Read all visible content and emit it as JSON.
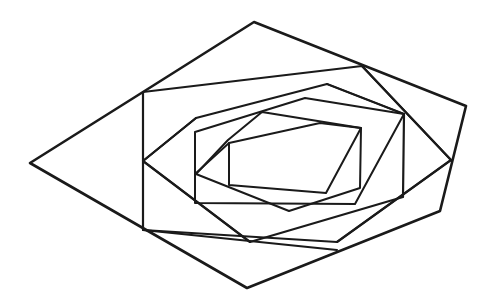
{
  "diagram": {
    "type": "nested-spiral-hexagons",
    "background": "#ffffff",
    "stroke_color": "#1a1a1a",
    "polygons": [
      {
        "name": "hexagon-0-outer",
        "width": 2.6,
        "points": [
          [
            254,
            22
          ],
          [
            466,
            106
          ],
          [
            440,
            211
          ],
          [
            247,
            288
          ],
          [
            30,
            163
          ],
          [
            143,
            92
          ]
        ]
      },
      {
        "name": "hexagon-1",
        "width": 2.2,
        "points": [
          [
            143,
            92
          ],
          [
            362,
            66
          ],
          [
            451,
            160
          ],
          [
            337,
            242
          ],
          [
            143,
            230
          ],
          [
            143,
            92
          ]
        ]
      },
      {
        "name": "hexagon-2",
        "width": 2.2,
        "points": [
          [
            196,
            118
          ],
          [
            327,
            84
          ],
          [
            404,
            114
          ],
          [
            403,
            197
          ],
          [
            250,
            242
          ],
          [
            143,
            161
          ]
        ]
      },
      {
        "name": "hexagon-3",
        "width": 2.0,
        "points": [
          [
            195,
            132
          ],
          [
            305,
            98
          ],
          [
            404,
            114
          ],
          [
            355,
            204
          ],
          [
            195,
            203
          ],
          [
            195,
            132
          ]
        ]
      },
      {
        "name": "hexagon-4",
        "width": 2.0,
        "points": [
          [
            228,
            140
          ],
          [
            262,
            112
          ],
          [
            361,
            128
          ],
          [
            360,
            188
          ],
          [
            289,
            211
          ],
          [
            196,
            174
          ]
        ]
      },
      {
        "name": "hexagon-5-inner",
        "width": 2.0,
        "points": [
          [
            229,
            143
          ],
          [
            320,
            123
          ],
          [
            361,
            128
          ],
          [
            326,
            193
          ],
          [
            229,
            185
          ],
          [
            229,
            143
          ]
        ]
      }
    ],
    "connector_lines": [
      {
        "name": "spiral-line-1",
        "width": 2.0,
        "from": [
          362,
          66
        ],
        "to": [
          451,
          160
        ]
      },
      {
        "name": "spiral-line-2",
        "width": 2.0,
        "from": [
          451,
          160
        ],
        "to": [
          337,
          242
        ]
      },
      {
        "name": "spiral-line-3",
        "width": 2.0,
        "from": [
          143,
          230
        ],
        "to": [
          337,
          250
        ]
      },
      {
        "name": "spiral-line-4",
        "width": 2.0,
        "from": [
          143,
          161
        ],
        "to": [
          250,
          242
        ]
      },
      {
        "name": "spiral-line-5",
        "width": 2.0,
        "from": [
          143,
          161
        ],
        "to": [
          196,
          118
        ]
      },
      {
        "name": "spiral-line-6",
        "width": 1.8,
        "from": [
          327,
          84
        ],
        "to": [
          404,
          114
        ]
      },
      {
        "name": "spiral-line-7",
        "width": 1.8,
        "from": [
          195,
          174
        ],
        "to": [
          229,
          143
        ]
      }
    ]
  }
}
